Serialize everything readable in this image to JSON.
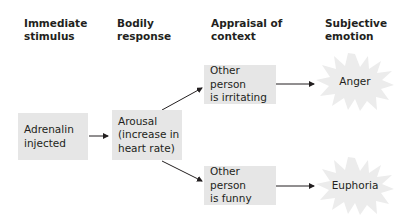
{
  "headers": [
    {
      "label": "Immediate\nstimulus"
    },
    {
      "label": "Bodily\nresponse"
    },
    {
      "label": "Appraisal of\ncontext"
    },
    {
      "label": "Subjective\nemotion"
    }
  ],
  "nodes": {
    "stimulus": "Adrenalin\ninjected",
    "response": "Arousal\n(increase in\nheart rate)",
    "appraisal_irritating": "Other person\nis irritating",
    "appraisal_funny": "Other person\nis funny",
    "emotion_anger": "Anger",
    "emotion_euphoria": "Euphoria"
  },
  "colors": {
    "box_fill": "#e6e6e6",
    "burst_fill": "#ececec",
    "arrow": "#231f20",
    "text": "#231f20"
  }
}
